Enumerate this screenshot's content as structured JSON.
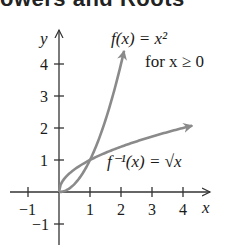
{
  "heading": {
    "text": "owers and Roots"
  },
  "chart_data": {
    "type": "line",
    "title": "",
    "xlabel": "x",
    "ylabel": "y",
    "xlim": [
      -1.5,
      4.9
    ],
    "ylim": [
      -1.7,
      4.8
    ],
    "x_ticks": [
      -1,
      1,
      2,
      3,
      4
    ],
    "y_ticks": [
      -1,
      1,
      2,
      3,
      4
    ],
    "x_tick_labels": [
      "−1",
      "1",
      "2",
      "3",
      "4"
    ],
    "y_tick_labels": [
      "−1",
      "1",
      "2",
      "3",
      "4"
    ],
    "grid": false,
    "series": [
      {
        "name": "f(x) = x^2 for x ≥ 0",
        "label_line1": "f(x) = x²",
        "label_line2": "for x ≥ 0",
        "x": [
          0,
          0.5,
          1,
          1.5,
          2,
          2.1
        ],
        "y": [
          0,
          0.25,
          1,
          2.25,
          4,
          4.41
        ],
        "arrow_end": true
      },
      {
        "name": "f^-1(x) = √x",
        "label": "f⁻¹(x) = √x",
        "x": [
          0,
          0.25,
          1,
          2,
          3,
          4.3
        ],
        "y": [
          0,
          0.5,
          1,
          1.414,
          1.732,
          2.07
        ],
        "arrow_end": true
      }
    ],
    "colors": {
      "curve": "#8a8a8a",
      "axis": "#333333",
      "text": "#1a1a1a"
    }
  }
}
